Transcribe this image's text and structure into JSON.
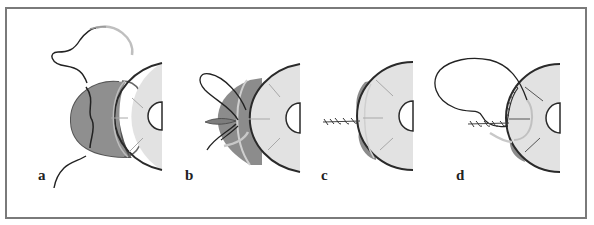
{
  "figure": {
    "type": "surgical-suture-technique-illustration",
    "panels": [
      {
        "id": "a",
        "label": "a",
        "description": "Curved needle with suture passing through darker tissue flap adjacent to light disc"
      },
      {
        "id": "b",
        "label": "b",
        "description": "Suture looped and tied forming knot at tissue edge"
      },
      {
        "id": "c",
        "label": "c",
        "description": "Completed twisted suture with tissue compressed against disc"
      },
      {
        "id": "d",
        "label": "d",
        "description": "Running suture around disc margin with looped thread and needle"
      }
    ],
    "colors": {
      "frame": "#7a7a7a",
      "disc_fill": "#e2e2e2",
      "disc_stroke": "#2a2a2a",
      "tissue_fill": "#8c8c8c",
      "tissue_light": "#a9a9a9",
      "needle": "#c8c8c8",
      "thread": "#222222",
      "spoke": "#a8a8a8"
    }
  }
}
